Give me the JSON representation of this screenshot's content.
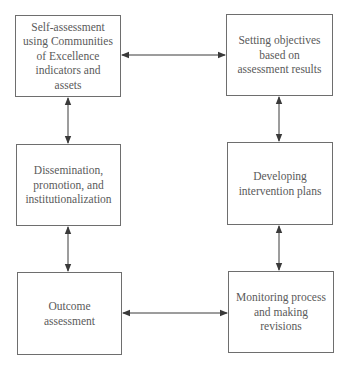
{
  "diagram": {
    "type": "cycle-flowchart",
    "colors": {
      "border": "#6e6e6e",
      "text": "#5a5a5a",
      "arrow": "#3a3a3a",
      "background": "#ffffff"
    },
    "nodes": [
      {
        "id": "self-assessment",
        "label": "Self-assessment\nusing Communities\nof Excellence\nindicators and\nassets"
      },
      {
        "id": "setting-objectives",
        "label": "Setting objectives\nbased on\nassessment results"
      },
      {
        "id": "dissemination",
        "label": "Dissemination,\npromotion, and\ninstitutionalization"
      },
      {
        "id": "developing-plans",
        "label": "Developing\nintervention plans"
      },
      {
        "id": "outcome-assessment",
        "label": "Outcome\nassessment"
      },
      {
        "id": "monitoring",
        "label": "Monitoring process\nand making\nrevisions"
      }
    ],
    "edges": [
      {
        "from": "self-assessment",
        "to": "setting-objectives",
        "direction": "bidirectional"
      },
      {
        "from": "setting-objectives",
        "to": "developing-plans",
        "direction": "bidirectional"
      },
      {
        "from": "developing-plans",
        "to": "monitoring",
        "direction": "bidirectional"
      },
      {
        "from": "monitoring",
        "to": "outcome-assessment",
        "direction": "bidirectional"
      },
      {
        "from": "outcome-assessment",
        "to": "dissemination",
        "direction": "bidirectional"
      },
      {
        "from": "dissemination",
        "to": "self-assessment",
        "direction": "bidirectional"
      }
    ]
  }
}
